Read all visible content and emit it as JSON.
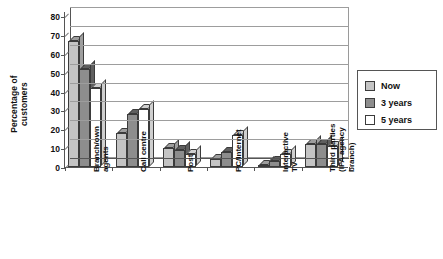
{
  "chart_data": {
    "type": "bar",
    "title": "",
    "xlabel": "",
    "ylabel": "Percentage of\ncustomers",
    "ylim": [
      0,
      80
    ],
    "yticks": [
      "0",
      "10",
      "20",
      "30",
      "40",
      "50",
      "60",
      "70",
      "80"
    ],
    "grid": true,
    "legend_position": "right",
    "categories": [
      "Branch/own\nagents",
      "Call centre",
      "Post",
      "PC/Internet",
      "Interactive\nTV",
      "Third parties\n(IFA agency\nbranch)"
    ],
    "series": [
      {
        "name": "Now",
        "color": "#c4c4c4",
        "values": [
          67,
          18,
          10,
          4,
          0,
          12
        ]
      },
      {
        "name": "3 years",
        "color": "#8d8d8d",
        "values": [
          52,
          28,
          9,
          8,
          3,
          12
        ]
      },
      {
        "name": "5 years",
        "color": "#ffffff",
        "values": [
          42,
          31,
          7,
          17,
          7,
          11
        ]
      }
    ]
  },
  "legend": {
    "items": [
      {
        "label": "Now"
      },
      {
        "label": "3 years"
      },
      {
        "label": "5 years"
      }
    ]
  },
  "axis": {
    "y_title": "Percentage of\ncustomers"
  }
}
